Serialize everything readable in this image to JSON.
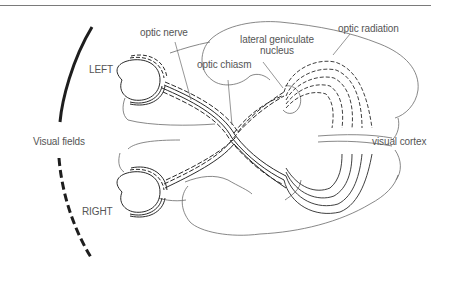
{
  "diagram": {
    "labels": {
      "optic_nerve": "optic nerve",
      "lateral_geniculate_line1": "lateral geniculate",
      "lateral_geniculate_line2": "nucleus",
      "optic_chiasm": "optic chiasm",
      "optic_radiation": "optic radiation",
      "visual_cortex": "visual cortex",
      "visual_fields": "Visual fields",
      "left": "LEFT",
      "right": "RIGHT"
    },
    "colors": {
      "stroke": "#2a2a2a",
      "outline": "#6a6a6a",
      "text": "#555555",
      "rule": "#7a7a7a"
    }
  }
}
